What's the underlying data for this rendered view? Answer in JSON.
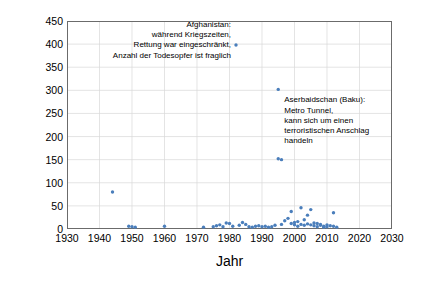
{
  "chart_data": {
    "type": "scatter",
    "title": "",
    "xlabel": "Jahr",
    "ylabel": "Anzahl Todesopfer",
    "xlim": [
      1930,
      2030
    ],
    "ylim": [
      0,
      450
    ],
    "xticks": [
      1930,
      1940,
      1950,
      1960,
      1970,
      1980,
      1990,
      2000,
      2010,
      2020,
      2030
    ],
    "yticks": [
      0,
      50,
      100,
      150,
      200,
      250,
      300,
      350,
      400,
      450
    ],
    "grid": true,
    "legend": null,
    "marker_color": "#4a7ebb",
    "series": [
      {
        "name": "Todesopfer pro Ereignis",
        "points": [
          [
            1944,
            80
          ],
          [
            1949,
            6
          ],
          [
            1950,
            5
          ],
          [
            1951,
            4
          ],
          [
            1960,
            6
          ],
          [
            1972,
            4
          ],
          [
            1975,
            5
          ],
          [
            1976,
            7
          ],
          [
            1977,
            9
          ],
          [
            1978,
            5
          ],
          [
            1979,
            13
          ],
          [
            1980,
            12
          ],
          [
            1981,
            6
          ],
          [
            1982,
            398
          ],
          [
            1983,
            8
          ],
          [
            1984,
            14
          ],
          [
            1985,
            10
          ],
          [
            1986,
            5
          ],
          [
            1987,
            4
          ],
          [
            1988,
            6
          ],
          [
            1989,
            7
          ],
          [
            1990,
            5
          ],
          [
            1991,
            6
          ],
          [
            1992,
            4
          ],
          [
            1993,
            5
          ],
          [
            1994,
            8
          ],
          [
            1995,
            302
          ],
          [
            1995,
            152
          ],
          [
            1996,
            150
          ],
          [
            1996,
            10
          ],
          [
            1997,
            18
          ],
          [
            1998,
            23
          ],
          [
            1999,
            12
          ],
          [
            1999,
            38
          ],
          [
            2000,
            14
          ],
          [
            2000,
            9
          ],
          [
            2001,
            16
          ],
          [
            2001,
            6
          ],
          [
            2002,
            10
          ],
          [
            2002,
            46
          ],
          [
            2003,
            20
          ],
          [
            2003,
            8
          ],
          [
            2004,
            11
          ],
          [
            2004,
            30
          ],
          [
            2005,
            9
          ],
          [
            2005,
            42
          ],
          [
            2006,
            13
          ],
          [
            2006,
            7
          ],
          [
            2007,
            12
          ],
          [
            2007,
            5
          ],
          [
            2008,
            10
          ],
          [
            2008,
            8
          ],
          [
            2009,
            6
          ],
          [
            2009,
            4
          ],
          [
            2010,
            9
          ],
          [
            2010,
            5
          ],
          [
            2011,
            7
          ],
          [
            2012,
            35
          ],
          [
            2012,
            6
          ],
          [
            2013,
            4
          ]
        ]
      }
    ],
    "annotations": [
      {
        "id": "afghanistan",
        "lines": [
          "Afghanistan:",
          "während Kriegszeiten,",
          "Rettung war eingeschränkt,",
          "Anzahl der Todesopfer ist fraglich"
        ],
        "anchor_x": 1982,
        "anchor_y": 398
      },
      {
        "id": "baku",
        "lines": [
          "Aserbaidschan (Baku):",
          "Metro Tunnel,",
          "kann sich um einen",
          "terroristischen Anschlag",
          "handeln"
        ],
        "anchor_x": 1995,
        "anchor_y": 302
      }
    ]
  }
}
